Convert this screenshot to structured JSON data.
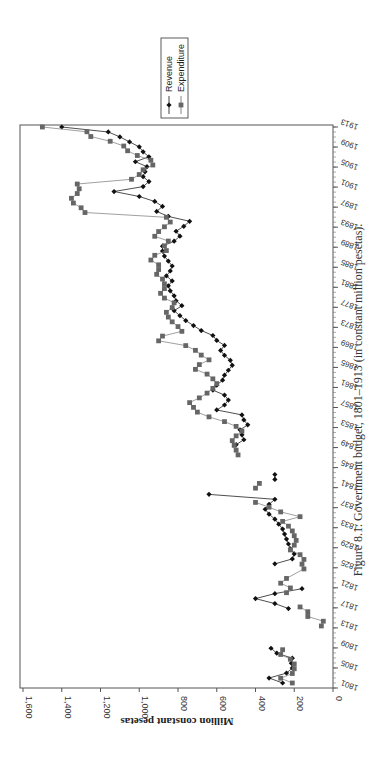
{
  "figure": {
    "caption": "Figure 8.1. Government budget, 1801–1913 (in constant million pesetas).",
    "orientation": "rotated-90-ccw"
  },
  "legend": {
    "items": [
      {
        "label": "Revenue",
        "marker": "diamond",
        "color": "#111111"
      },
      {
        "label": "Expenditure",
        "marker": "square",
        "color": "#666666"
      }
    ]
  },
  "chart_data": {
    "type": "line",
    "title": "Government budget, 1801–1913 (in constant million pesetas)",
    "xlabel": "",
    "ylabel": "Million constant pesetas",
    "ylim": [
      0,
      1600
    ],
    "xlim": [
      1801,
      1913
    ],
    "yticks": [
      "0",
      "200",
      "400",
      "600",
      "800",
      "1,000",
      "1,200",
      "1,400",
      "1,600"
    ],
    "xticks": [
      "1801",
      "1805",
      "1809",
      "1813",
      "1817",
      "1821",
      "1825",
      "1829",
      "1833",
      "1837",
      "1841",
      "1845",
      "1849",
      "1853",
      "1857",
      "1861",
      "1865",
      "1869",
      "1873",
      "1877",
      "1881",
      "1885",
      "1889",
      "1893",
      "1897",
      "1901",
      "1905",
      "1909",
      "1913"
    ],
    "grid": false,
    "legend_position": "right",
    "series": [
      {
        "name": "Revenue",
        "points": [
          [
            1802,
            260
          ],
          [
            1803,
            330
          ],
          [
            1804,
            240
          ],
          [
            1805,
            210
          ],
          [
            1806,
            215
          ],
          [
            1807,
            210
          ],
          [
            1808,
            290
          ],
          [
            1809,
            320
          ],
          null,
          [
            1817,
            230
          ],
          [
            1818,
            300
          ],
          [
            1819,
            400
          ],
          [
            1820,
            300
          ],
          [
            1821,
            160
          ],
          [
            1822,
            null
          ],
          [
            1826,
            300
          ],
          [
            1827,
            210
          ],
          [
            1828,
            200
          ],
          [
            1829,
            220
          ],
          [
            1830,
            230
          ],
          [
            1831,
            240
          ],
          [
            1832,
            250
          ],
          [
            1833,
            260
          ],
          [
            1834,
            280
          ],
          [
            1835,
            300
          ],
          [
            1836,
            330
          ],
          [
            1837,
            350
          ],
          [
            1838,
            330
          ],
          [
            1839,
            300
          ],
          [
            1840,
            640
          ],
          null,
          [
            1843,
            300
          ],
          [
            1844,
            300
          ],
          null,
          [
            1850,
            500
          ],
          [
            1851,
            460
          ],
          [
            1852,
            470
          ],
          [
            1853,
            480
          ],
          [
            1854,
            440
          ],
          [
            1855,
            460
          ],
          [
            1856,
            470
          ],
          [
            1857,
            600
          ],
          [
            1858,
            560
          ],
          [
            1859,
            540
          ],
          [
            1860,
            560
          ],
          [
            1861,
            620
          ],
          [
            1862,
            600
          ],
          [
            1863,
            570
          ],
          [
            1864,
            560
          ],
          [
            1865,
            540
          ],
          [
            1866,
            520
          ],
          [
            1867,
            530
          ],
          [
            1868,
            560
          ],
          [
            1869,
            580
          ],
          [
            1870,
            560
          ],
          [
            1871,
            600
          ],
          [
            1872,
            620
          ],
          [
            1873,
            680
          ],
          [
            1874,
            720
          ],
          [
            1875,
            760
          ],
          [
            1876,
            790
          ],
          [
            1877,
            820
          ],
          [
            1878,
            780
          ],
          [
            1879,
            810
          ],
          [
            1880,
            820
          ],
          [
            1881,
            840
          ],
          [
            1882,
            850
          ],
          [
            1883,
            830
          ],
          [
            1884,
            860
          ],
          [
            1885,
            840
          ],
          [
            1886,
            830
          ],
          [
            1887,
            850
          ],
          [
            1888,
            870
          ],
          [
            1889,
            880
          ],
          [
            1890,
            880
          ],
          [
            1891,
            820
          ],
          [
            1892,
            790
          ],
          [
            1893,
            810
          ],
          [
            1894,
            770
          ],
          [
            1895,
            740
          ],
          [
            1896,
            850
          ],
          [
            1897,
            910
          ],
          [
            1898,
            880
          ],
          [
            1899,
            920
          ],
          [
            1900,
            1000
          ],
          [
            1901,
            1130
          ],
          [
            1902,
            980
          ],
          [
            1903,
            950
          ],
          [
            1904,
            980
          ],
          [
            1905,
            970
          ],
          [
            1906,
            960
          ],
          [
            1907,
            1020
          ],
          [
            1908,
            950
          ],
          [
            1909,
            980
          ],
          [
            1910,
            1000
          ],
          [
            1911,
            1050
          ],
          [
            1912,
            1100
          ],
          [
            1913,
            1160
          ],
          [
            1914,
            1400
          ]
        ]
      },
      {
        "name": "Expenditure",
        "points": [
          [
            1802,
            210
          ],
          [
            1803,
            270
          ],
          [
            1804,
            210
          ],
          [
            1805,
            200
          ],
          [
            1806,
            200
          ],
          [
            1807,
            220
          ],
          [
            1808,
            270
          ],
          [
            1809,
            260
          ],
          null,
          [
            1814,
            60
          ],
          [
            1815,
            50
          ],
          [
            1816,
            130
          ],
          [
            1817,
            130
          ],
          [
            1818,
            170
          ],
          [
            1819,
            null
          ],
          [
            1821,
            240
          ],
          [
            1822,
            220
          ],
          [
            1823,
            270
          ],
          [
            1824,
            240
          ],
          [
            1826,
            150
          ],
          [
            1827,
            160
          ],
          [
            1828,
            150
          ],
          [
            1829,
            170
          ],
          [
            1830,
            220
          ],
          [
            1831,
            200
          ],
          [
            1832,
            190
          ],
          [
            1833,
            200
          ],
          [
            1834,
            210
          ],
          [
            1835,
            230
          ],
          [
            1836,
            260
          ],
          [
            1837,
            170
          ],
          [
            1838,
            270
          ],
          [
            1839,
            330
          ],
          [
            1840,
            400
          ],
          null,
          [
            1843,
            400
          ],
          [
            1844,
            380
          ],
          null,
          [
            1850,
            490
          ],
          [
            1851,
            500
          ],
          [
            1852,
            510
          ],
          [
            1853,
            520
          ],
          [
            1854,
            500
          ],
          [
            1855,
            470
          ],
          [
            1856,
            500
          ],
          [
            1857,
            560
          ],
          [
            1858,
            640
          ],
          [
            1859,
            700
          ],
          [
            1860,
            720
          ],
          [
            1861,
            740
          ],
          [
            1862,
            690
          ],
          [
            1863,
            650
          ],
          [
            1864,
            620
          ],
          [
            1865,
            600
          ],
          [
            1866,
            620
          ],
          [
            1867,
            650
          ],
          [
            1868,
            710
          ],
          [
            1869,
            690
          ],
          [
            1870,
            640
          ],
          [
            1871,
            680
          ],
          [
            1872,
            710
          ],
          [
            1873,
            760
          ],
          [
            1874,
            900
          ],
          [
            1875,
            880
          ],
          [
            1876,
            780
          ],
          [
            1877,
            800
          ],
          [
            1878,
            830
          ],
          [
            1879,
            850
          ],
          [
            1880,
            860
          ],
          [
            1881,
            830
          ],
          [
            1882,
            820
          ],
          [
            1883,
            870
          ],
          [
            1884,
            890
          ],
          [
            1885,
            870
          ],
          [
            1886,
            870
          ],
          [
            1887,
            880
          ],
          [
            1888,
            910
          ],
          [
            1889,
            900
          ],
          [
            1890,
            900
          ],
          [
            1891,
            940
          ],
          [
            1892,
            920
          ],
          [
            1893,
            860
          ],
          [
            1894,
            870
          ],
          [
            1895,
            850
          ],
          [
            1896,
            920
          ],
          [
            1897,
            900
          ],
          [
            1898,
            870
          ],
          [
            1899,
            840
          ],
          [
            1900,
            860
          ],
          [
            1901,
            1280
          ],
          [
            1902,
            1300
          ],
          [
            1903,
            1340
          ],
          [
            1904,
            1350
          ],
          [
            1905,
            1320
          ],
          [
            1906,
            1310
          ],
          [
            1907,
            1320
          ],
          [
            1908,
            1040
          ],
          [
            1909,
            1000
          ],
          [
            1910,
            980
          ],
          [
            1911,
            930
          ],
          [
            1912,
            940
          ],
          [
            1913,
            1010
          ],
          [
            1914,
            1060
          ],
          [
            1915,
            1080
          ],
          [
            1916,
            1150
          ],
          [
            1917,
            1250
          ],
          [
            1918,
            1270
          ],
          [
            1919,
            1500
          ]
        ]
      }
    ]
  }
}
